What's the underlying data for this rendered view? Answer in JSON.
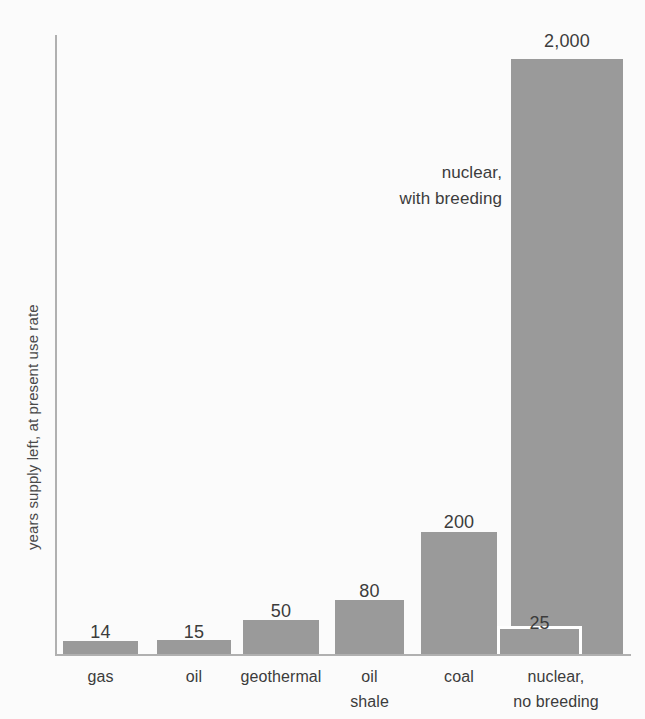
{
  "chart_data": {
    "type": "bar",
    "title": "",
    "subtitle": "",
    "xlabel": "",
    "ylabel": "years supply left, at present use rate",
    "grid": false,
    "legend": "none",
    "axis_note": "vertical scale is visually compressed; bar heights are not linearly proportional to values",
    "categories": [
      "gas",
      "oil",
      "geothermal",
      "oil\nshale",
      "coal",
      "nuclear,\nno breeding"
    ],
    "values": [
      14,
      15,
      50,
      80,
      200,
      25
    ],
    "value_labels": [
      "14",
      "15",
      "50",
      "80",
      "200",
      "25"
    ],
    "extra_series": [
      {
        "name": "nuclear, with breeding",
        "value": 2000,
        "value_label": "2,000",
        "category": "nuclear"
      }
    ],
    "annotations": [
      {
        "text": "nuclear,\nwith breeding",
        "target": "2000-bar"
      }
    ],
    "colors": {
      "bar_fill": "#9a9a9a",
      "axis": "#b0b0b0",
      "background": "#fbfbfb",
      "text": "#3c3c3c",
      "overlay_keyline": "#ffffff"
    }
  },
  "bars": [
    {
      "label": "gas",
      "value_label": "14",
      "left": 63,
      "width": 75,
      "height": 13,
      "value_y": 622
    },
    {
      "label": "oil",
      "value_label": "15",
      "left": 157,
      "width": 74,
      "height": 14,
      "value_y": 622
    },
    {
      "label": "geothermal",
      "value_label": "50",
      "left": 243,
      "width": 76,
      "height": 34,
      "value_y": 601
    },
    {
      "label": "oil\nshale",
      "value_label": "80",
      "left": 335,
      "width": 69,
      "height": 54,
      "value_y": 581
    },
    {
      "label": "coal",
      "value_label": "200",
      "left": 421,
      "width": 76,
      "height": 122,
      "value_y": 512
    }
  ],
  "tall_bar": {
    "label": "nuclear,\nno breeding",
    "value_label": "2,000",
    "left": 511,
    "width": 112,
    "height": 595,
    "value_y": 31
  },
  "overlay_bar": {
    "value_label": "25",
    "left": 497,
    "width": 85,
    "height": 28,
    "value_y": 613
  },
  "cat_labels": [
    {
      "text": "gas",
      "left": 63,
      "width": 75,
      "top": 664
    },
    {
      "text": "oil",
      "left": 157,
      "width": 74,
      "top": 664
    },
    {
      "text": "geothermal",
      "left": 231,
      "width": 100,
      "top": 664
    },
    {
      "text": "oil\nshale",
      "left": 335,
      "width": 69,
      "top": 664
    },
    {
      "text": "coal",
      "left": 421,
      "width": 76,
      "top": 664
    },
    {
      "text": "nuclear,\nno breeding",
      "left": 483,
      "width": 146,
      "top": 664
    }
  ],
  "annotation": {
    "text": "nuclear,\nwith breeding",
    "left": 330,
    "top": 160,
    "width": 172
  },
  "y_axis": {
    "title": "years supply left, at present use rate"
  }
}
